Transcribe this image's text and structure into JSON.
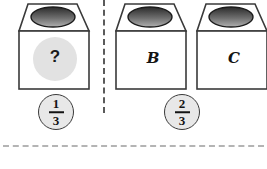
{
  "figure": {
    "type": "probability-jars-diagram",
    "width": 267,
    "height": 169,
    "background_color": "#ffffff"
  },
  "boxes": [
    {
      "id": "box-unknown",
      "label": "?",
      "label_kind": "question-mark",
      "x": 16,
      "lid_ellipse_color_top": "#2e2e2e",
      "lid_ellipse_color_bottom": "#a8a8a8",
      "body_fill": "#ffffff",
      "outline_color": "#3a3a3a",
      "highlight_disc_color": "#e2e2e2"
    },
    {
      "id": "box-b",
      "label": "B",
      "label_kind": "letter",
      "x": 113,
      "lid_ellipse_color_top": "#2e2e2e",
      "lid_ellipse_color_bottom": "#a8a8a8",
      "body_fill": "#ffffff",
      "outline_color": "#3a3a3a"
    },
    {
      "id": "box-c",
      "label": "C",
      "label_kind": "letter",
      "x": 194,
      "lid_ellipse_color_top": "#2e2e2e",
      "lid_ellipse_color_bottom": "#a8a8a8",
      "body_fill": "#ffffff",
      "outline_color": "#3a3a3a"
    }
  ],
  "fractions": [
    {
      "id": "fraction-one-third",
      "numerator": "1",
      "denominator": "3",
      "x": 38,
      "y": 94,
      "fill_color": "#e8e8e8",
      "border_color": "#3a3a3a"
    },
    {
      "id": "fraction-two-thirds",
      "numerator": "2",
      "denominator": "3",
      "x": 164,
      "y": 94,
      "fill_color": "#e8e8e8",
      "border_color": "#3a3a3a"
    }
  ],
  "dividers": {
    "vertical_dashed": {
      "name": "vertical-dashed-divider",
      "color": "#5a5a5a",
      "x": 103,
      "top": 0,
      "height": 113
    },
    "horizontal_dotted": {
      "name": "horizontal-dotted-rule",
      "color": "#b4b4b4",
      "y": 145,
      "left": 3,
      "width": 261
    }
  }
}
